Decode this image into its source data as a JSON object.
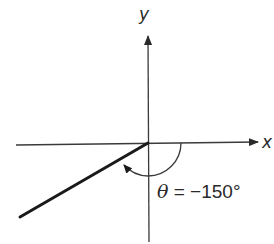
{
  "diagram": {
    "type": "angle-in-standard-position",
    "axes": {
      "x_label": "x",
      "y_label": "y"
    },
    "angle": {
      "symbol": "θ",
      "equals": " = ",
      "value": "−150°",
      "degrees": -150,
      "direction": "clockwise"
    },
    "colors": {
      "axis": "#3a3a3a",
      "ray": "#1a1a1a",
      "arc": "#3a3a3a",
      "text": "#2a2a2a",
      "background": "#ffffff"
    }
  }
}
